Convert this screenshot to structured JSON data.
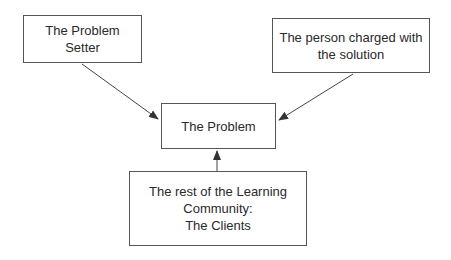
{
  "diagram": {
    "nodes": [
      {
        "id": "problem-setter",
        "lines": [
          "The Problem",
          "Setter"
        ]
      },
      {
        "id": "solution-person",
        "lines": [
          "The person charged with",
          "the solution"
        ]
      },
      {
        "id": "problem",
        "lines": [
          "The Problem"
        ]
      },
      {
        "id": "clients",
        "lines": [
          "The rest of the Learning",
          "Community:",
          "The Clients"
        ]
      }
    ],
    "edges": [
      {
        "from": "problem-setter",
        "to": "problem"
      },
      {
        "from": "solution-person",
        "to": "problem"
      },
      {
        "from": "clients",
        "to": "problem"
      }
    ],
    "colors": {
      "line": "#444444",
      "text": "#2a2a2a",
      "background": "#ffffff"
    }
  }
}
